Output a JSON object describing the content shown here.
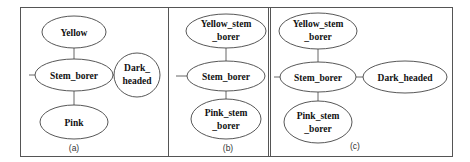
{
  "figure": {
    "panels": [
      {
        "id": "a",
        "caption": "(a)",
        "nodes": {
          "top": [
            "Yellow"
          ],
          "center": [
            "Stem_borer"
          ],
          "right": [
            "Dark_",
            "headed"
          ],
          "bottom": [
            "Pink"
          ]
        }
      },
      {
        "id": "b",
        "caption": "(b)",
        "nodes": {
          "top": [
            "Yellow_stem",
            "_borer"
          ],
          "center": [
            "Stem_borer"
          ],
          "bottom": [
            "Pink_stem",
            "_borer"
          ]
        }
      },
      {
        "id": "c",
        "caption": "(c)",
        "nodes": {
          "top": [
            "Yellow_stem",
            "_borer"
          ],
          "center": [
            "Stem_borer"
          ],
          "right": [
            "Dark_headed"
          ],
          "bottom": [
            "Pink_stem",
            "_borer"
          ]
        }
      }
    ]
  }
}
